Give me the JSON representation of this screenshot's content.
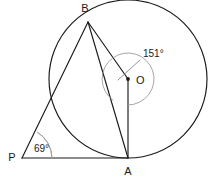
{
  "figure": {
    "kind": "circle-geometry-diagram",
    "background_color": "#ffffff",
    "line_color": "#1a1a1a",
    "arc_color": "#9b9b9b",
    "width": 211,
    "height": 182
  },
  "points": {
    "B": {
      "label": "B",
      "x": 88,
      "y": 22,
      "label_x": 85,
      "label_y": 12
    },
    "O": {
      "label": "O",
      "x": 128,
      "y": 79,
      "label_x": 136,
      "label_y": 84
    },
    "A": {
      "label": "A",
      "x": 128,
      "y": 158,
      "label_x": 128,
      "label_y": 175
    },
    "P": {
      "label": "P",
      "x": 22,
      "y": 158,
      "label_x": 12,
      "label_y": 161
    }
  },
  "circle": {
    "center_x": 128,
    "center_y": 79,
    "radius": 79
  },
  "angles": [
    {
      "id": "angle-at-center",
      "value": "151",
      "unit": "°",
      "label": "151°",
      "vertex": "O",
      "label_x": 143,
      "label_y": 57,
      "arc_radius": 26,
      "start_deg": 235,
      "end_deg": 90
    },
    {
      "id": "angle-at-p",
      "value": "69",
      "unit": "°",
      "label": "69°",
      "vertex": "P",
      "label_x": 34,
      "label_y": 152,
      "arc_radius": 30,
      "start_deg": 0,
      "end_deg": 59
    }
  ],
  "segments": [
    {
      "id": "segment-PA",
      "from": "P",
      "to": "A"
    },
    {
      "id": "segment-PB",
      "from": "P",
      "to": "B"
    },
    {
      "id": "segment-BA",
      "from": "B",
      "to": "A"
    },
    {
      "id": "segment-BO",
      "from": "B",
      "to": "O"
    },
    {
      "id": "segment-OA",
      "from": "O",
      "to": "A"
    }
  ]
}
